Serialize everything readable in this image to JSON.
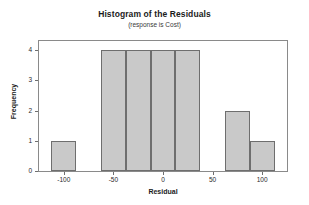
{
  "chart_data": {
    "type": "bar",
    "title": "Histogram of the Residuals",
    "subtitle": "(response is Cost)",
    "xlabel": "Residual",
    "ylabel": "Frequency",
    "xlim": [
      -125,
      125
    ],
    "ylim": [
      0,
      4.3
    ],
    "grid": false,
    "legend": null,
    "bin_width": 25,
    "bins": [
      {
        "left": -112.5,
        "right": -87.5,
        "center": -100,
        "value": 1
      },
      {
        "left": -62.5,
        "right": -37.5,
        "center": -50,
        "value": 4
      },
      {
        "left": -37.5,
        "right": -12.5,
        "center": -25,
        "value": 4
      },
      {
        "left": -12.5,
        "right": 12.5,
        "center": 0,
        "value": 4
      },
      {
        "left": 12.5,
        "right": 37.5,
        "center": 25,
        "value": 4
      },
      {
        "left": 62.5,
        "right": 87.5,
        "center": 75,
        "value": 2
      },
      {
        "left": 87.5,
        "right": 112.5,
        "center": 100,
        "value": 1
      }
    ],
    "categories": [
      "-100",
      "-50",
      "-25",
      "0",
      "25",
      "75",
      "100"
    ],
    "values": [
      1,
      4,
      4,
      4,
      4,
      2,
      1
    ],
    "xticks": [
      {
        "value": -100,
        "label": "-100"
      },
      {
        "value": -50,
        "label": "-50"
      },
      {
        "value": 0,
        "label": "0"
      },
      {
        "value": 50,
        "label": "50"
      },
      {
        "value": 100,
        "label": "100"
      }
    ],
    "yticks": [
      {
        "value": 0,
        "label": "0"
      },
      {
        "value": 1,
        "label": "1"
      },
      {
        "value": 2,
        "label": "2"
      },
      {
        "value": 3,
        "label": "3"
      },
      {
        "value": 4,
        "label": "4"
      }
    ],
    "colors": {
      "bar_fill": "#c9c9c9",
      "bar_border": "#6e6e6e",
      "frame": "#8a8a8a",
      "text": "#1b1b1b",
      "background": "#ffffff"
    }
  }
}
